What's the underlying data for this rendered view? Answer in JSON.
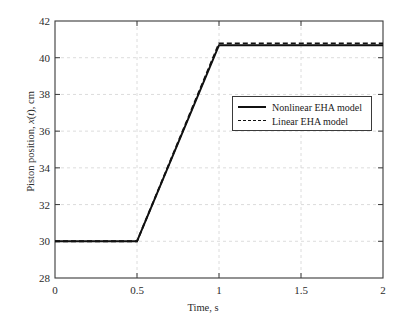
{
  "chart_data": {
    "type": "line",
    "title": "",
    "xlabel": "Time, s",
    "ylabel": "Piston position, x(t), cm",
    "ylabel_parts": {
      "prefix": "Piston position, ",
      "italic": "x",
      "middle": "(",
      "italic2": "t",
      "suffix": "), cm"
    },
    "xlim": [
      0,
      2
    ],
    "ylim": [
      28,
      42
    ],
    "xticks": [
      0,
      0.5,
      1,
      1.5,
      2
    ],
    "xtick_labels": [
      "0",
      "0.5",
      "1",
      "1.5",
      "2"
    ],
    "yticks": [
      28,
      30,
      32,
      34,
      36,
      38,
      40,
      42
    ],
    "ytick_labels": [
      "28",
      "30",
      "32",
      "34",
      "36",
      "38",
      "40",
      "42"
    ],
    "grid": true,
    "grid_style": "dashed",
    "grid_color": "#d8d8d8",
    "legend_position": "center-right",
    "series": [
      {
        "name": "Nonlinear EHA model",
        "style": "solid",
        "color": "#111111",
        "x": [
          0,
          0.5,
          1.0,
          2.0
        ],
        "values": [
          30.0,
          30.0,
          40.68,
          40.68
        ]
      },
      {
        "name": "Linear EHA model",
        "style": "dashed",
        "color": "#111111",
        "x": [
          0,
          0.5,
          1.0,
          2.0
        ],
        "values": [
          30.0,
          30.0,
          40.78,
          40.78
        ]
      }
    ]
  },
  "legend": {
    "items": [
      {
        "label": "Nonlinear EHA model",
        "style": "solid"
      },
      {
        "label": "Linear EHA model",
        "style": "dashed"
      }
    ]
  }
}
